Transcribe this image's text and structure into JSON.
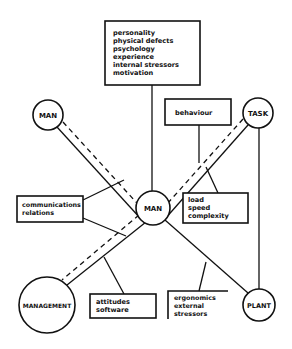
{
  "colors": {
    "ink": "#111111",
    "background": "#ffffff"
  },
  "nodes": {
    "man_top": {
      "label": "MAN",
      "cx": 48,
      "cy": 115,
      "r": 15
    },
    "task": {
      "label": "TASK",
      "cx": 258,
      "cy": 113,
      "r": 15
    },
    "man_center": {
      "label": "MAN",
      "cx": 153,
      "cy": 208,
      "r": 17
    },
    "management": {
      "label": "MANAGEMENT",
      "cx": 47,
      "cy": 305,
      "r": 28
    },
    "plant": {
      "label": "PLANT",
      "cx": 259,
      "cy": 305,
      "r": 16
    }
  },
  "boxes": {
    "individual_factors": {
      "lines": [
        "personality",
        "physical defects",
        "psychology",
        "experience",
        "internal stressors",
        "motivation"
      ]
    },
    "behaviour": {
      "lines": [
        "behaviour"
      ]
    },
    "communications": {
      "lines": [
        "communications",
        "relations"
      ]
    },
    "task_demands": {
      "lines": [
        "load",
        "speed",
        "complexity"
      ]
    },
    "attitudes": {
      "lines": [
        "attitudes",
        "software"
      ]
    },
    "environment": {
      "lines": [
        "ergonomics",
        "external",
        "stressors"
      ]
    }
  }
}
